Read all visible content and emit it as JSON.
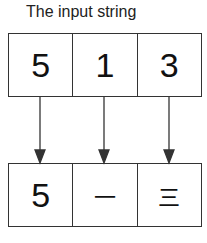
{
  "title": "The input string",
  "input": [
    "5",
    "1",
    "3"
  ],
  "output": [
    "5",
    "一",
    "三"
  ],
  "colors": {
    "stroke": "#333333",
    "text": "#111111"
  }
}
